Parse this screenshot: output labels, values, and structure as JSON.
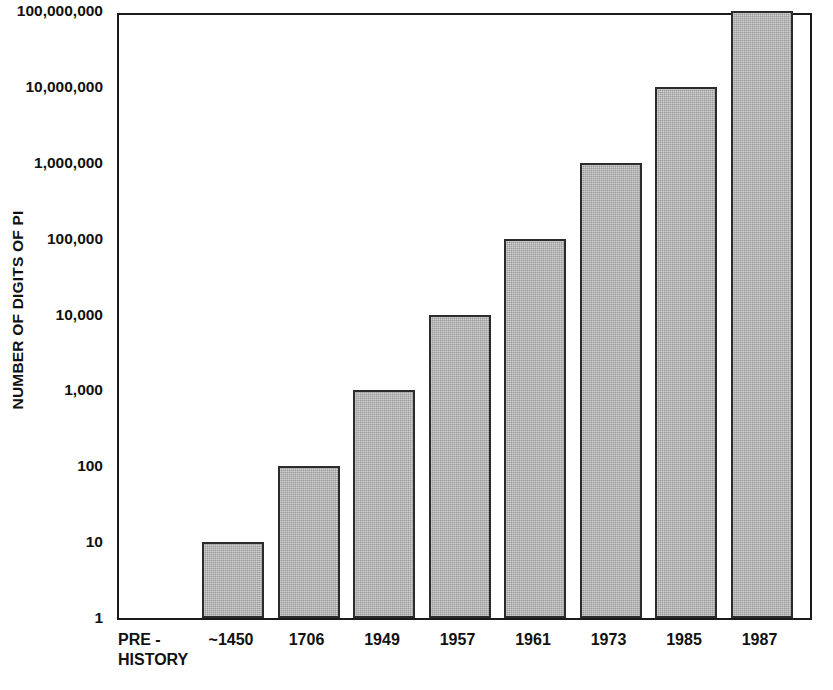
{
  "chart_data": {
    "type": "bar",
    "title": "",
    "xlabel": "",
    "ylabel": "NUMBER OF DIGITS OF PI",
    "scale": "log10",
    "ylim": [
      1,
      100000000
    ],
    "grid": false,
    "legend": null,
    "categories": [
      "PRE -\nHISTORY",
      "~1450",
      "1706",
      "1949",
      "1957",
      "1961",
      "1973",
      "1985",
      "1987"
    ],
    "values": [
      null,
      10,
      100,
      1000,
      10000,
      100000,
      1000000,
      10000000,
      100000000
    ],
    "ytick_labels": [
      "100,000,000",
      "10,000,000",
      "1,000,000",
      "100,000",
      "10,000",
      "1,000",
      "100",
      "10",
      "1"
    ],
    "ytick_values": [
      100000000,
      10000000,
      1000000,
      100000,
      10000,
      1000,
      100,
      10,
      1
    ],
    "colors": {
      "bar_fill": "#9a9a9a",
      "bar_border": "#2b2b2b",
      "axis": "#1a1a1a",
      "text": "#111111",
      "background": "#ffffff"
    }
  }
}
